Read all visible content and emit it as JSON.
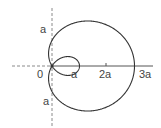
{
  "diagram": {
    "type": "polar-curve",
    "curve": "limacon-with-inner-loop",
    "equation_implied": "r = a(1 + 2cos θ)",
    "labels": {
      "origin": "0",
      "loop_end": "a",
      "tick_2a": "2a",
      "tick_3a": "3a",
      "y_top": "a",
      "y_bottom": "a"
    },
    "colors": {
      "curve": "#333333",
      "axis": "#555555",
      "dashed_axis": "#888888"
    }
  }
}
